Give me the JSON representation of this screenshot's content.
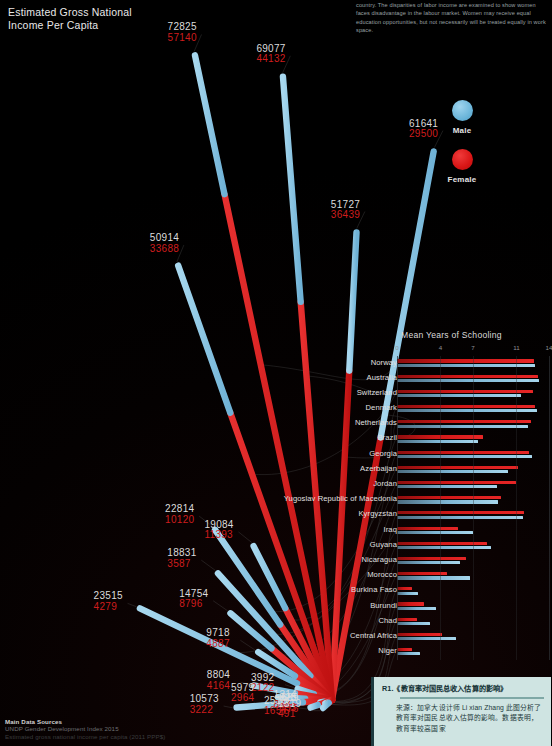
{
  "title": "Estimated Gross National\nIncome Per Capita",
  "intro": "country. The disparities of labor income are examined to show women faces disadvantage in the labour market. Women may receive equal education opportunities, but not necessarily will be treated equally in work space.",
  "legend": {
    "male_label": "Male",
    "female_label": "Female",
    "male_color": "#7fb9d9",
    "female_color": "#d81515"
  },
  "sources": {
    "heading": "Main Data Sources",
    "line1": "UNDP Gender Development Index 2015",
    "line2": "Estimated gross national income per capita (2011 PPP$)"
  },
  "annotation": {
    "title": "R1.《教育率对国民总收入估算的影响》",
    "body": "来源：加拿大设计师 Li xian Zhang 此图分析了教育率对国民总收入估算的影响。数据表明，教育率较高国家"
  },
  "chart_data": {
    "type": "bar",
    "title": "Mean Years of Schooling",
    "xlabel": "",
    "ylabel": "",
    "xlim": [
      0,
      14
    ],
    "ticks": [
      0,
      4,
      7,
      11,
      14
    ],
    "grid": true,
    "legend_position": "top-right",
    "categories": [
      "Norway",
      "Australia",
      "Switzerland",
      "Denmark",
      "Netherlands",
      "Brazil",
      "Georgia",
      "Azerbaijan",
      "Jordan",
      "Yugoslav Republic of Macedonia",
      "Kyrgyzstan",
      "Iraq",
      "Guyana",
      "Nicaragua",
      "Morocco",
      "Burkina Faso",
      "Burundi",
      "Chad",
      "Central Africa",
      "Niger"
    ],
    "series": [
      {
        "name": "Female",
        "color": "#d81515",
        "values": [
          12.6,
          13.0,
          12.5,
          12.7,
          12.3,
          7.9,
          12.2,
          11.1,
          11.0,
          9.6,
          11.7,
          5.6,
          8.3,
          6.4,
          4.6,
          1.4,
          2.5,
          1.8,
          4.1,
          1.4
        ]
      },
      {
        "name": "Male",
        "color": "#7fb9d9",
        "values": [
          12.7,
          13.1,
          11.4,
          12.9,
          12.1,
          7.5,
          12.4,
          10.2,
          9.2,
          9.3,
          11.6,
          7.0,
          8.7,
          5.8,
          6.7,
          1.9,
          3.6,
          3.0,
          5.4,
          2.1
        ]
      }
    ]
  },
  "rays": [
    {
      "country": "Norway",
      "male": 72825,
      "female": 57140
    },
    {
      "country": "Australia",
      "male": 69077,
      "female": 44132
    },
    {
      "country": "Switzerland",
      "male": 50914,
      "female": 33688
    },
    {
      "country": "Denmark",
      "male": 51727,
      "female": 36439
    },
    {
      "country": "Netherlands",
      "male": 61641,
      "female": 29500
    },
    {
      "country": "Brazil",
      "male": 19084,
      "female": 11393
    },
    {
      "country": "Georgia",
      "male": 9718,
      "female": 4887
    },
    {
      "country": "Azerbaijan",
      "male": 22814,
      "female": 10120
    },
    {
      "country": "Jordan",
      "male": 18831,
      "female": 3587
    },
    {
      "country": "Yugoslav Republic of Macedonia",
      "male": 14754,
      "female": 8796
    },
    {
      "country": "Kyrgyzstan",
      "male": 3992,
      "female": 2122
    },
    {
      "country": "Iraq",
      "male": 23515,
      "female": 4279
    },
    {
      "country": "Guyana",
      "male": 8804,
      "female": 4164
    },
    {
      "country": "Nicaragua",
      "male": 5979,
      "female": 2964
    },
    {
      "country": "Morocco",
      "male": 10573,
      "female": 3222
    },
    {
      "country": "Burkina Faso",
      "male": 1314,
      "female": 877
    },
    {
      "country": "Burundi",
      "male": 825,
      "female": 693
    },
    {
      "country": "Chad",
      "male": 2513,
      "female": 1657
    },
    {
      "country": "Central Africa",
      "male": 689,
      "female": 476
    },
    {
      "country": "Niger",
      "male": 1319,
      "female": 491
    }
  ]
}
